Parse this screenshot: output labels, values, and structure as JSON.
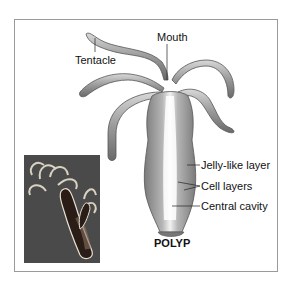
{
  "figure": {
    "caption": "POLYP",
    "labels": {
      "mouth": "Mouth",
      "tentacle": "Tentacle",
      "jelly_layer": "Jelly-like layer",
      "cell_layers": "Cell layers",
      "central_cavity": "Central cavity"
    },
    "inset_photo": "hydra-micrograph",
    "colors": {
      "frame_border": "#9a9a9a",
      "body_gray": "#8a8a8a",
      "photo_bg": "#4a4a4a"
    }
  }
}
